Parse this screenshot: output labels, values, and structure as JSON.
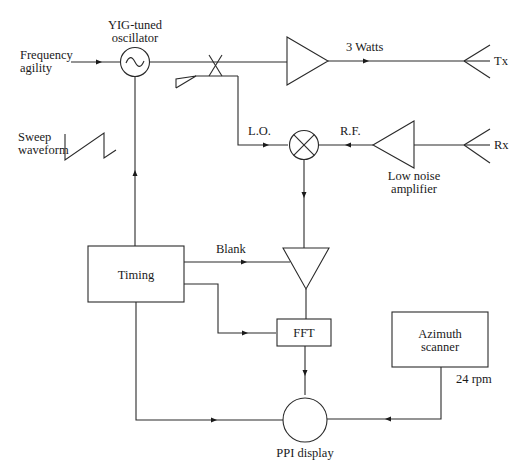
{
  "diagram": {
    "labels": {
      "yig_line1": "YIG-tuned",
      "yig_line2": "oscillator",
      "freq_line1": "Frequency",
      "freq_line2": "agility",
      "sweep_line1": "Sweep",
      "sweep_line2": "waveform",
      "power": "3 Watts",
      "tx": "Tx",
      "rx": "Rx",
      "lo": "L.O.",
      "rf": "R.F.",
      "lna_line1": "Low noise",
      "lna_line2": "amplifier",
      "timing": "Timing",
      "blank": "Blank",
      "fft": "FFT",
      "azimuth_line1": "Azimuth",
      "azimuth_line2": "scanner",
      "rpm": "24 rpm",
      "ppi": "PPI display"
    },
    "nodes": [
      {
        "id": "yig-oscillator",
        "type": "circle",
        "label": "YIG-tuned oscillator"
      },
      {
        "id": "power-amplifier",
        "type": "triangle",
        "label": ""
      },
      {
        "id": "tx-antenna",
        "type": "antenna",
        "label": "Tx"
      },
      {
        "id": "rx-antenna",
        "type": "antenna",
        "label": "Rx"
      },
      {
        "id": "low-noise-amplifier",
        "type": "triangle",
        "label": "Low noise amplifier"
      },
      {
        "id": "mixer",
        "type": "circle",
        "label": ""
      },
      {
        "id": "directional-coupler",
        "type": "coupler",
        "label": ""
      },
      {
        "id": "if-amplifier",
        "type": "triangle",
        "label": ""
      },
      {
        "id": "timing",
        "type": "box",
        "label": "Timing"
      },
      {
        "id": "fft",
        "type": "box",
        "label": "FFT"
      },
      {
        "id": "azimuth-scanner",
        "type": "box",
        "label": "Azimuth scanner"
      },
      {
        "id": "ppi-display",
        "type": "circle",
        "label": "PPI display"
      }
    ],
    "edges": [
      {
        "from": "frequency-agility",
        "to": "yig-oscillator"
      },
      {
        "from": "yig-oscillator",
        "to": "power-amplifier"
      },
      {
        "from": "power-amplifier",
        "to": "tx-antenna",
        "label": "3 Watts"
      },
      {
        "from": "directional-coupler",
        "to": "mixer",
        "label": "L.O."
      },
      {
        "from": "rx-antenna",
        "to": "low-noise-amplifier"
      },
      {
        "from": "low-noise-amplifier",
        "to": "mixer",
        "label": "R.F."
      },
      {
        "from": "mixer",
        "to": "if-amplifier"
      },
      {
        "from": "timing",
        "to": "yig-oscillator"
      },
      {
        "from": "timing",
        "to": "if-amplifier",
        "label": "Blank"
      },
      {
        "from": "timing",
        "to": "fft"
      },
      {
        "from": "if-amplifier",
        "to": "fft"
      },
      {
        "from": "fft",
        "to": "ppi-display"
      },
      {
        "from": "timing",
        "to": "ppi-display"
      },
      {
        "from": "azimuth-scanner",
        "to": "ppi-display",
        "label": "24 rpm"
      }
    ]
  }
}
